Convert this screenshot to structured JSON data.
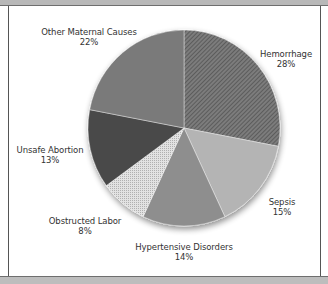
{
  "chart_data": {
    "type": "pie",
    "title": "",
    "start_angle": "12 o'clock, clockwise",
    "slices": [
      {
        "label": "Hemorrhage",
        "value": 28,
        "pct_label": "28%",
        "fill": "#6a6a6a",
        "pattern": "diagonal-hatch"
      },
      {
        "label": "Sepsis",
        "value": 15,
        "pct_label": "15%",
        "fill": "#b4b4b4",
        "pattern": "solid"
      },
      {
        "label": "Hypertensive Disorders",
        "value": 14,
        "pct_label": "14%",
        "fill": "#8e8e8e",
        "pattern": "solid"
      },
      {
        "label": "Obstructed Labor",
        "value": 8,
        "pct_label": "8%",
        "fill": "#dcdcdc",
        "pattern": "stipple"
      },
      {
        "label": "Unsafe Abortion",
        "value": 13,
        "pct_label": "13%",
        "fill": "#4a4a4a",
        "pattern": "solid"
      },
      {
        "label": "Other Maternal Causes",
        "value": 22,
        "pct_label": "22%",
        "fill": "#7a7a7a",
        "pattern": "solid"
      }
    ],
    "legend": "none (inline labels)"
  },
  "labels": {
    "hemorrhage": {
      "name": "Hemorrhage",
      "pct": "28%"
    },
    "sepsis": {
      "name": "Sepsis",
      "pct": "15%"
    },
    "hypertensive": {
      "name": "Hypertensive Disorders",
      "pct": "14%"
    },
    "obstructed": {
      "name": "Obstructed Labor",
      "pct": "8%"
    },
    "abortion": {
      "name": "Unsafe Abortion",
      "pct": "13%"
    },
    "other": {
      "name": "Other Maternal Causes",
      "pct": "22%"
    }
  }
}
